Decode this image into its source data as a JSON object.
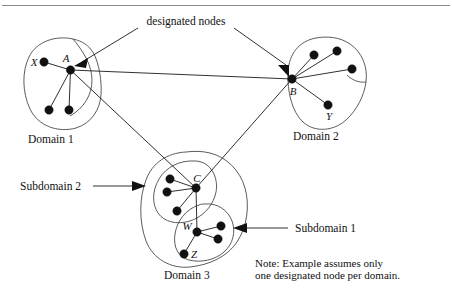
{
  "figure": {
    "width": 452,
    "height": 289,
    "background": "#ffffff",
    "line_color": "#1a1a1a",
    "blob_color": "#4a4a4a",
    "node_color": "#111111",
    "rule_color": "#8a8a8a"
  },
  "callouts": {
    "designated_nodes": "designated nodes",
    "subdomain_2": "Subdomain 2",
    "subdomain_1": "Subdomain 1"
  },
  "domains": {
    "domain_1": "Domain 1",
    "domain_2": "Domain 2",
    "domain_3": "Domain 3"
  },
  "nodes": {
    "A": "A",
    "B": "B",
    "C": "C",
    "W": "W",
    "X": "X",
    "Y": "Y",
    "Z": "Z"
  },
  "note": {
    "line1": "Note: Example assumes only",
    "line2": "one designated node per domain."
  }
}
